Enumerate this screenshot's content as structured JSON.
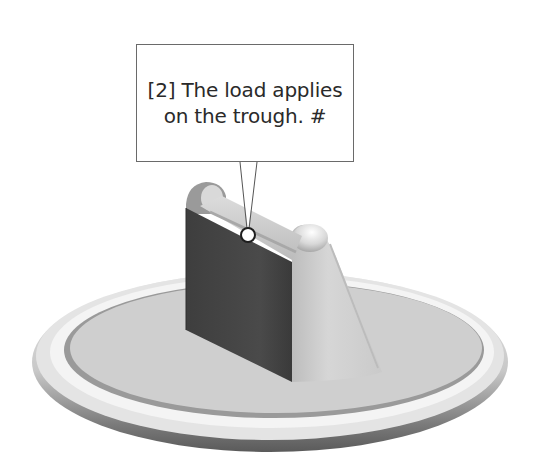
{
  "callout": {
    "line1": "[2] The load applies",
    "line2": "on the trough.  #",
    "step_number": "2",
    "border_color": "#6a6a6a",
    "text_color": "#2a2a2a"
  },
  "model": {
    "description": "3D shaded part: circular base plate with raised rim, vertical bracket with trough on top and sloped gusset",
    "load_point_marker": "circle",
    "colors": {
      "front_face": "#4a4a4a",
      "base_top": "#cfcfcf",
      "rim_highlight": "#f2f2f2",
      "rim_shadow": "#6e6e6e",
      "gusset": "#d4d4d4"
    }
  }
}
